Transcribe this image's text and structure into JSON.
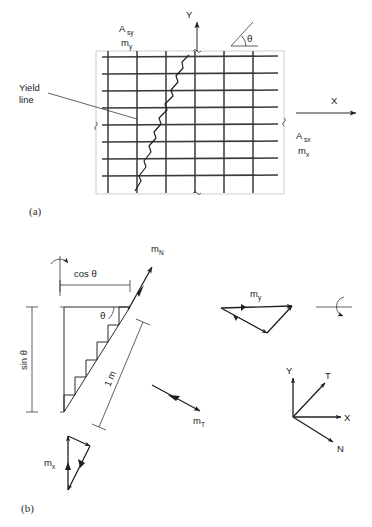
{
  "figure": {
    "panels": [
      {
        "id": "a",
        "label": "(a)"
      },
      {
        "id": "b",
        "label": "(b)"
      }
    ]
  },
  "panel_a": {
    "label": "(a)",
    "labels": {
      "asy": "A",
      "asy_sub": "sy",
      "my": "m",
      "my_sub": "y",
      "asx": "A",
      "asx_sub": "sx",
      "mx": "m",
      "mx_sub": "x",
      "yield_line_1": "Yield",
      "yield_line_2": "line",
      "axis_y": "Y",
      "axis_x": "X",
      "theta": "θ"
    },
    "grid": {
      "rows": 8,
      "cols": 6
    }
  },
  "panel_b": {
    "label": "(b)",
    "labels": {
      "cos_theta": "cos  θ",
      "sin_theta": "sin θ",
      "one_metre": "1 m",
      "theta": "θ",
      "mn": "m",
      "mn_sub": "N",
      "mt": "m",
      "mt_sub": "T",
      "my": "m",
      "my_sub": "y",
      "mx": "m",
      "mx_sub": "x",
      "axis_y": "Y",
      "axis_x": "X",
      "axis_t": "T",
      "axis_n": "N"
    },
    "steps": 6
  },
  "colors": {
    "background": "#ffffff",
    "ink": "#1f1f1f",
    "grid_heavy": "#3a3a3a",
    "grid_light": "#b9b9b9"
  }
}
